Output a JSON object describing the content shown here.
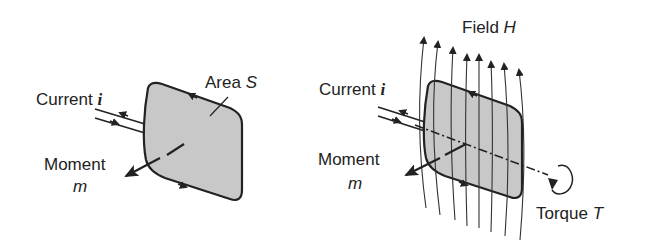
{
  "left_diagram": {
    "current_label": "Current",
    "current_symbol": "i",
    "area_label": "Area",
    "area_symbol": "S",
    "moment_label": "Moment",
    "moment_symbol": "m"
  },
  "right_diagram": {
    "field_label": "Field",
    "field_symbol": "H",
    "current_label": "Current",
    "current_symbol": "i",
    "moment_label": "Moment",
    "moment_symbol": "m",
    "torque_label": "Torque",
    "torque_symbol": "T"
  },
  "colors": {
    "loop_fill": "#c8c8c8",
    "stroke": "#222222"
  }
}
